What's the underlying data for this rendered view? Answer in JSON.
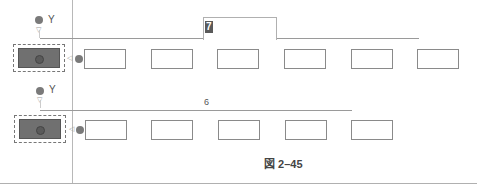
{
  "diagram": {
    "caption": "図 2–45",
    "rows": [
      {
        "y_label": "Y",
        "x_label": "X",
        "dimension_value": "7",
        "dimension_state": "editing",
        "box_count": 6
      },
      {
        "y_label": "Y",
        "x_label": "X",
        "dimension_value": "6",
        "dimension_state": "static",
        "box_count": 5
      }
    ],
    "colors": {
      "selected_fill": "#707070",
      "box_border": "#8a8a8a",
      "line": "#9a9a9a"
    }
  }
}
